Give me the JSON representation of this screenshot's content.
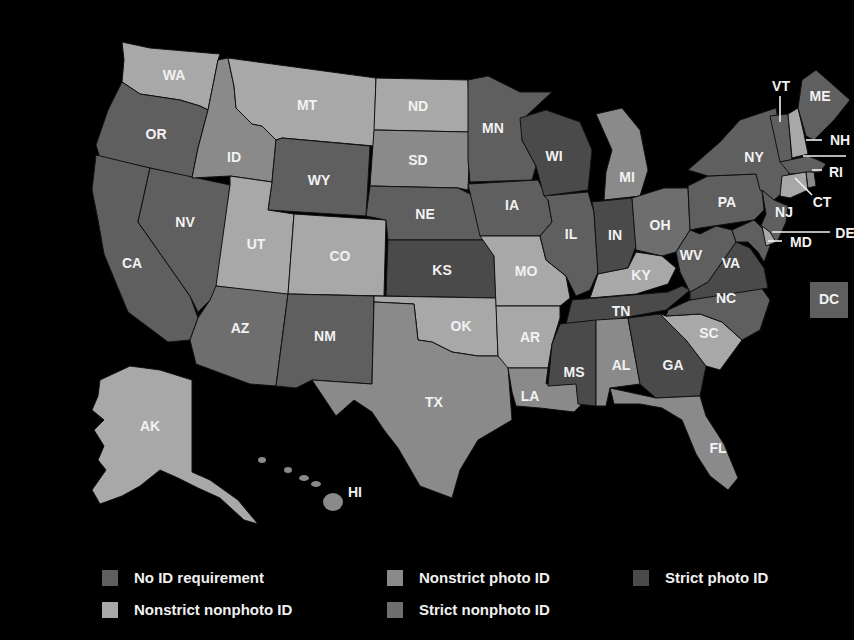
{
  "colors": {
    "no_id": "#5f5f5f",
    "nonstrict_nonphoto": "#a8a8a8",
    "nonstrict_photo": "#8a8a8a",
    "strict_nonphoto": "#6e6e6e",
    "strict_photo": "#4a4a4a",
    "background": "#000000"
  },
  "legend": [
    {
      "key": "no_id",
      "label": "No ID requirement"
    },
    {
      "key": "nonstrict_photo",
      "label": "Nonstrict photo ID"
    },
    {
      "key": "strict_photo",
      "label": "Strict photo ID"
    },
    {
      "key": "nonstrict_nonphoto",
      "label": "Nonstrict nonphoto ID"
    },
    {
      "key": "strict_nonphoto",
      "label": "Strict nonphoto ID"
    }
  ],
  "states": {
    "WA": {
      "label": "WA",
      "category": "nonstrict_nonphoto"
    },
    "OR": {
      "label": "OR",
      "category": "no_id"
    },
    "CA": {
      "label": "CA",
      "category": "no_id"
    },
    "NV": {
      "label": "NV",
      "category": "no_id"
    },
    "ID": {
      "label": "ID",
      "category": "nonstrict_photo"
    },
    "MT": {
      "label": "MT",
      "category": "nonstrict_nonphoto"
    },
    "WY": {
      "label": "WY",
      "category": "no_id"
    },
    "UT": {
      "label": "UT",
      "category": "nonstrict_nonphoto"
    },
    "CO": {
      "label": "CO",
      "category": "nonstrict_nonphoto"
    },
    "AZ": {
      "label": "AZ",
      "category": "strict_nonphoto"
    },
    "NM": {
      "label": "NM",
      "category": "no_id"
    },
    "ND": {
      "label": "ND",
      "category": "nonstrict_nonphoto"
    },
    "SD": {
      "label": "SD",
      "category": "nonstrict_photo"
    },
    "NE": {
      "label": "NE",
      "category": "no_id"
    },
    "KS": {
      "label": "KS",
      "category": "strict_photo"
    },
    "OK": {
      "label": "OK",
      "category": "nonstrict_nonphoto"
    },
    "TX": {
      "label": "TX",
      "category": "nonstrict_photo"
    },
    "MN": {
      "label": "MN",
      "category": "no_id"
    },
    "IA": {
      "label": "IA",
      "category": "no_id"
    },
    "MO": {
      "label": "MO",
      "category": "nonstrict_nonphoto"
    },
    "AR": {
      "label": "AR",
      "category": "nonstrict_nonphoto"
    },
    "LA": {
      "label": "LA",
      "category": "nonstrict_photo"
    },
    "WI": {
      "label": "WI",
      "category": "strict_photo"
    },
    "IL": {
      "label": "IL",
      "category": "no_id"
    },
    "MS": {
      "label": "MS",
      "category": "strict_photo"
    },
    "MI": {
      "label": "MI",
      "category": "nonstrict_photo"
    },
    "IN": {
      "label": "IN",
      "category": "strict_photo"
    },
    "KY": {
      "label": "KY",
      "category": "nonstrict_nonphoto"
    },
    "TN": {
      "label": "TN",
      "category": "strict_photo"
    },
    "AL": {
      "label": "AL",
      "category": "nonstrict_photo"
    },
    "GA": {
      "label": "GA",
      "category": "strict_photo"
    },
    "FL": {
      "label": "FL",
      "category": "nonstrict_photo"
    },
    "SC": {
      "label": "SC",
      "category": "nonstrict_nonphoto"
    },
    "NC": {
      "label": "NC",
      "category": "no_id"
    },
    "VA": {
      "label": "VA",
      "category": "strict_photo"
    },
    "WV": {
      "label": "WV",
      "category": "no_id"
    },
    "OH": {
      "label": "OH",
      "category": "strict_nonphoto"
    },
    "PA": {
      "label": "PA",
      "category": "no_id"
    },
    "NY": {
      "label": "NY",
      "category": "no_id"
    },
    "NJ": {
      "label": "NJ",
      "category": "no_id"
    },
    "DE": {
      "label": "DE",
      "category": "nonstrict_nonphoto"
    },
    "MD": {
      "label": "MD",
      "category": "no_id"
    },
    "VT": {
      "label": "VT",
      "category": "no_id"
    },
    "NH": {
      "label": "NH",
      "category": "nonstrict_nonphoto"
    },
    "ME": {
      "label": "ME",
      "category": "no_id"
    },
    "MA": {
      "label": "",
      "category": "no_id"
    },
    "CT": {
      "label": "CT",
      "category": "nonstrict_nonphoto"
    },
    "RI": {
      "label": "RI",
      "category": "nonstrict_photo"
    },
    "DC": {
      "label": "DC",
      "category": "no_id"
    },
    "AK": {
      "label": "AK",
      "category": "nonstrict_nonphoto"
    },
    "HI": {
      "label": "HI",
      "category": "nonstrict_photo"
    }
  }
}
